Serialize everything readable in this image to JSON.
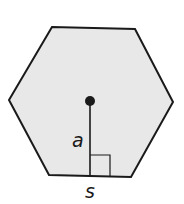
{
  "diagram": {
    "shape": "regular hexagon",
    "fill_color": "#e8e8e8",
    "stroke_color": "#1a1a1a",
    "labels": {
      "apothem": "a",
      "side": "s"
    },
    "features": [
      "center point",
      "apothem segment",
      "right-angle marker"
    ]
  }
}
